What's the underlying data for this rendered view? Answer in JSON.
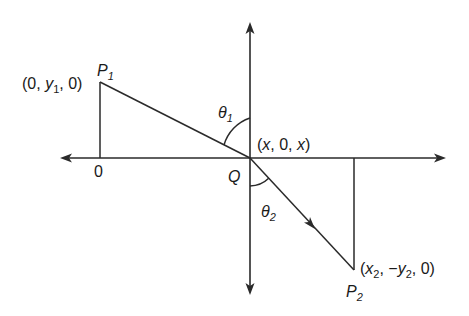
{
  "figure": {
    "type": "coordinate-geometry-diagram",
    "colors": {
      "background": "#ffffff",
      "stroke": "#2a2a2a",
      "text": "#1a1a1a"
    }
  },
  "labels": {
    "p1_name": "P",
    "p1_sub": "1",
    "p1_coord_open": "(0, ",
    "p1_coord_y": "y",
    "p1_coord_y_sub": "1",
    "p1_coord_close": ", 0)",
    "theta1": "θ",
    "theta1_sub": "1",
    "q_coord_open": "(",
    "q_coord_x1": "x",
    "q_coord_mid": ", 0, ",
    "q_coord_x2": "x",
    "q_coord_close": ")",
    "origin_zero": "0",
    "q_name": "Q",
    "theta2": "θ",
    "theta2_sub": "2",
    "p2_coord_open": "(",
    "p2_coord_x": "x",
    "p2_coord_x_sub": "2",
    "p2_coord_mid": ", −",
    "p2_coord_y": "y",
    "p2_coord_y_sub": "2",
    "p2_coord_close": ", 0)",
    "p2_name": "P",
    "p2_sub": "2"
  },
  "geometry": {
    "origin_Q": [
      250,
      158
    ],
    "P1": [
      100,
      82
    ],
    "P2": [
      354,
      270
    ],
    "horizontal_axis": {
      "from_x": 60,
      "to_x": 446,
      "y": 158,
      "arrows": "both"
    },
    "vertical_axis": {
      "x": 250,
      "from_y": 22,
      "to_y": 295,
      "arrows": "both"
    },
    "drop_lines": [
      {
        "from": [
          100,
          82
        ],
        "to": [
          100,
          158
        ]
      },
      {
        "from": [
          354,
          158
        ],
        "to": [
          354,
          270
        ]
      }
    ],
    "direction_arrow_on_segment_Q_P2": [
      312,
      226
    ]
  }
}
